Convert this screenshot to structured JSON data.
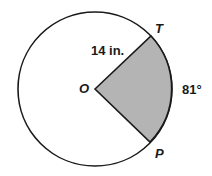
{
  "diagram": {
    "type": "circle-sector",
    "colors": {
      "background": "#ffffff",
      "stroke": "#1a1a1a",
      "sector_fill": "#b4b4b4"
    },
    "circle": {
      "center": [
        95,
        89
      ],
      "radius": 77
    },
    "points": {
      "center": {
        "label": "O",
        "pos": [
          95,
          89
        ]
      },
      "T": {
        "label": "T",
        "pos": [
          151,
          36
        ]
      },
      "P": {
        "label": "P",
        "pos": [
          150,
          142
        ]
      }
    },
    "labels": {
      "radius": "14 in.",
      "central_angle": "81°",
      "center": "O",
      "point_top": "T",
      "point_bottom": "P"
    },
    "measurements": {
      "radius_in": 14,
      "central_angle_deg": 81
    }
  }
}
